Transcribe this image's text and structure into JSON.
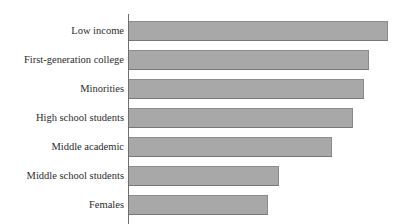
{
  "chart_data": {
    "type": "bar",
    "orientation": "horizontal",
    "title": "",
    "xlabel": "",
    "ylabel": "",
    "grid": false,
    "legend": null,
    "axis_tick_labels": [],
    "note": "Horizontal bar chart; title row is clipped off the top edge of the screenshot and x-axis tick labels are cropped off the bottom edge. Bar lengths read in pixels from the category axis at x=129.",
    "categories": [
      "Low income",
      "First-generation college",
      "Minorities",
      "High school students",
      "Middle academic",
      "Middle school students",
      "Females"
    ],
    "values": [
      100,
      93,
      90,
      86,
      78,
      58,
      54
    ],
    "value_unit": "relative length (percent of longest bar)",
    "bar_pixel_ends": [
      388,
      369,
      364,
      353,
      332,
      279,
      268
    ],
    "xlim": [
      0,
      100
    ]
  },
  "style": {
    "bar_fill": "#a8a8a8",
    "bar_border": "#8a8a8a",
    "axis_color": "#6e6e6e",
    "text_color": "#2b2b2b",
    "background": "#ffffff"
  }
}
